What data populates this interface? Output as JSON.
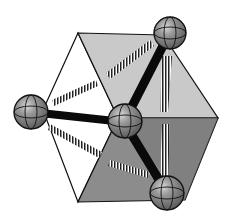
{
  "diagram": {
    "title": "",
    "colors": {
      "background": "#ffffff",
      "face_left": "#ffffff",
      "face_top_right": "#c8c8c8",
      "face_bottom": "#8a8a8a",
      "edge": "#111111",
      "bond": "#0a0a0a",
      "atom_fill": "#8f8f8f",
      "atom_highlight": "#e6e6e6"
    },
    "atoms": [
      {
        "id": "center",
        "label": ""
      },
      {
        "id": "top-right",
        "label": ""
      },
      {
        "id": "left",
        "label": ""
      },
      {
        "id": "bottom-right",
        "label": ""
      }
    ]
  }
}
